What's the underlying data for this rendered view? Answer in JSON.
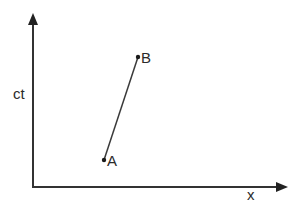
{
  "diagram": {
    "type": "spacetime-diagram",
    "axes": {
      "vertical": {
        "label": "ct"
      },
      "horizontal": {
        "label": "x"
      }
    },
    "points": [
      {
        "name": "A",
        "label": "A",
        "px": 104,
        "py": 160
      },
      {
        "name": "B",
        "label": "B",
        "px": 138,
        "py": 57
      }
    ],
    "segment": {
      "from": "A",
      "to": "B"
    },
    "colors": {
      "axis": "#333333",
      "line": "#3a3a3a",
      "point": "#1a1a1a",
      "text": "#2b2b2b",
      "background": "#ffffff"
    }
  }
}
